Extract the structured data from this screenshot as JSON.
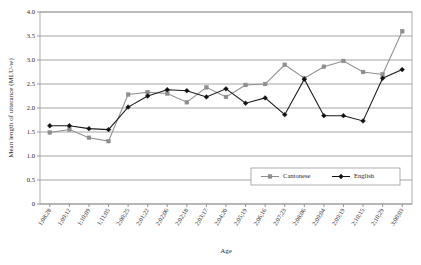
{
  "chart_data": {
    "type": "line",
    "title": "",
    "xlabel": "Age",
    "ylabel": "Mean length of utterance (MLU-w)",
    "ylim": [
      0,
      4.0
    ],
    "ytick_labels": [
      "0",
      "0.5",
      "1.0",
      "1.5",
      "2.0",
      "2.5",
      "3.0",
      "3.5",
      "4.0"
    ],
    "ytick_values": [
      0,
      0.5,
      1.0,
      1.5,
      2.0,
      2.5,
      3.0,
      3.5,
      4.0
    ],
    "grid": true,
    "legend_position": "inside-bottom-right",
    "categories": [
      "1;08;28",
      "1;09;12",
      "1;10;09",
      "1;11;05",
      "2;00;25",
      "2;01;22",
      "2;02;06",
      "2;02;18",
      "2;03;17",
      "2;04;20",
      "2;05;19",
      "2;06;16",
      "2;07;23",
      "2;08;06",
      "2;09;04",
      "2;09;19",
      "2;10;15",
      "2;10;29",
      "3;00;03"
    ],
    "series": [
      {
        "name": "Cantonese",
        "color": "#8e8e8e",
        "marker": "square",
        "values": [
          1.49,
          1.55,
          1.38,
          1.31,
          2.28,
          2.33,
          2.3,
          2.12,
          2.43,
          2.23,
          2.48,
          2.5,
          2.9,
          2.62,
          2.86,
          2.98,
          2.75,
          2.7,
          3.6
        ]
      },
      {
        "name": "English",
        "color": "#111111",
        "marker": "diamond",
        "values": [
          1.63,
          1.63,
          1.57,
          1.55,
          2.02,
          2.25,
          2.38,
          2.36,
          2.23,
          2.4,
          2.1,
          2.21,
          1.86,
          2.6,
          1.84,
          1.84,
          1.73,
          2.62,
          2.8
        ]
      }
    ]
  },
  "legend": {
    "items": [
      {
        "label": "Cantonese"
      },
      {
        "label": "English"
      }
    ]
  },
  "axes": {
    "x_title": "Age",
    "y_title": "Mean length of utterance (MLU-w)"
  }
}
